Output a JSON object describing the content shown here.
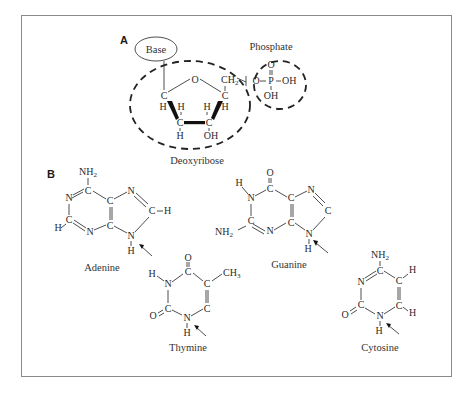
{
  "panels": {
    "a": {
      "label": "A"
    },
    "b": {
      "label": "B"
    }
  },
  "nucleotide": {
    "base_label": "Base",
    "phosphate_label": "Phosphate",
    "sugar_label": "Deoxyribose",
    "atoms": {
      "ring_o": "O",
      "c1": "C",
      "c2": "C",
      "c3": "C",
      "c4": "C",
      "ch2": "CH",
      "ch2_sub": "2",
      "h_c1": "H",
      "h_c2a": "H",
      "h_c2b": "H",
      "h_c3": "H",
      "h_c4": "H",
      "oh_c3": "OH",
      "phosphate_o_link": "O",
      "phosphate_p": "P",
      "phosphate_o_top": "O",
      "phosphate_oh_right": "OH",
      "phosphate_oh_bottom": "OH"
    }
  },
  "bases": [
    {
      "name": "Adenine",
      "type": "purine"
    },
    {
      "name": "Guanine",
      "type": "purine"
    },
    {
      "name": "Thymine",
      "type": "pyrimidine"
    },
    {
      "name": "Cytosine",
      "type": "pyrimidine"
    }
  ],
  "atoms": {
    "N": "N",
    "C": "C",
    "H": "H",
    "O": "O",
    "NH": "NH",
    "sub2": "2",
    "CH": "CH",
    "sub3": "3"
  },
  "colors": {
    "frame": "#8a8a8a",
    "ink": "#2a2a2a"
  }
}
